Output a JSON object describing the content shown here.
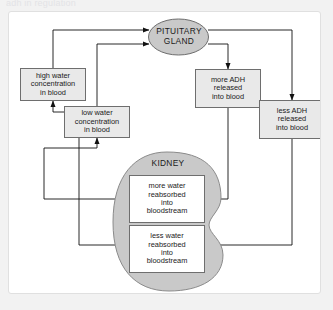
{
  "page": {
    "top_caption": "adh in regulation",
    "background_color": "#f2f2f2",
    "card_color": "#ffffff"
  },
  "diagram": {
    "type": "flow-diagram",
    "organs": [
      {
        "id": "pituitary",
        "name": "pituitary-gland",
        "label": "PITUITARY\nGLAND",
        "shape": "ellipse",
        "fill": "#c9c9c9",
        "stroke": "#6e6e6e"
      },
      {
        "id": "kidney",
        "name": "kidney",
        "label": "KIDNEY",
        "shape": "kidney-bean",
        "fill": "#c9c9c9",
        "stroke": "#8a8a8a"
      }
    ],
    "boxes": [
      {
        "id": "high-water",
        "name": "high-water-concentration-box",
        "label": "high water\nconcentration\nin blood",
        "fill": "#e9e9e9"
      },
      {
        "id": "low-water",
        "name": "low-water-concentration-box",
        "label": "low water\nconcentration\nin blood",
        "fill": "#e9e9e9"
      },
      {
        "id": "more-adh",
        "name": "more-adh-released-box",
        "label": "more ADH\nreleased\ninto blood",
        "fill": "#e9e9e9"
      },
      {
        "id": "less-adh",
        "name": "less-adh-released-box",
        "label": "less ADH\nreleased\ninto blood",
        "fill": "#e9e9e9"
      },
      {
        "id": "more-reabsorbed",
        "name": "more-water-reabsorbed-box",
        "label": "more water\nreabsorbed\ninto\nbloodstream",
        "fill": "#ffffff"
      },
      {
        "id": "less-reabsorbed",
        "name": "less-water-reabsorbed-box",
        "label": "less water\nreabsorbed\ninto\nbloodstream",
        "fill": "#ffffff"
      }
    ],
    "edges": [
      {
        "name": "edge-high-water-to-pituitary",
        "from": "high-water",
        "to": "pituitary"
      },
      {
        "name": "edge-low-water-to-pituitary",
        "from": "low-water",
        "to": "pituitary"
      },
      {
        "name": "edge-pituitary-to-less-adh",
        "from": "pituitary",
        "to": "less-adh"
      },
      {
        "name": "edge-pituitary-to-more-adh",
        "from": "pituitary",
        "to": "more-adh"
      },
      {
        "name": "edge-more-adh-to-more-reabsorbed",
        "from": "more-adh",
        "to": "more-reabsorbed"
      },
      {
        "name": "edge-less-adh-to-less-reabsorbed",
        "from": "less-adh",
        "to": "less-reabsorbed"
      },
      {
        "name": "edge-more-reabsorbed-to-low-water",
        "from": "more-reabsorbed",
        "to": "low-water"
      },
      {
        "name": "edge-less-reabsorbed-to-high-water",
        "from": "less-reabsorbed",
        "to": "high-water"
      }
    ]
  }
}
